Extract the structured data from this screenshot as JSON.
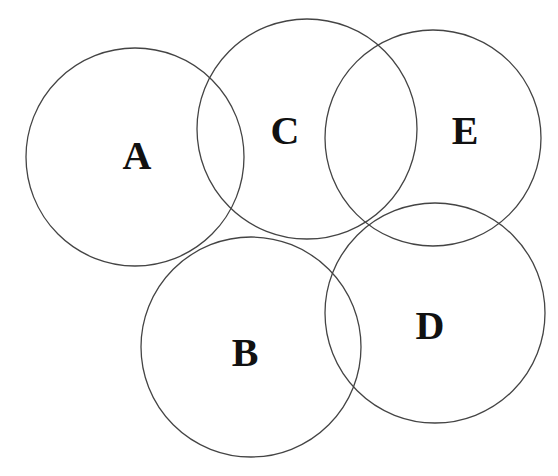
{
  "diagram": {
    "type": "overlapping-circles",
    "width": 558,
    "height": 476,
    "stroke_color": "#444444",
    "label_color": "#111111",
    "circles": [
      {
        "id": "A",
        "label": "A",
        "cx": 135,
        "cy": 157,
        "r": 109,
        "label_x": 137,
        "label_y": 155
      },
      {
        "id": "C",
        "label": "C",
        "cx": 307,
        "cy": 129,
        "r": 110,
        "label_x": 285,
        "label_y": 130
      },
      {
        "id": "E",
        "label": "E",
        "cx": 433,
        "cy": 138,
        "r": 108,
        "label_x": 465,
        "label_y": 130
      },
      {
        "id": "B",
        "label": "B",
        "cx": 251,
        "cy": 347,
        "r": 110,
        "label_x": 245,
        "label_y": 352
      },
      {
        "id": "D",
        "label": "D",
        "cx": 435,
        "cy": 313,
        "r": 110,
        "label_x": 430,
        "label_y": 325
      }
    ]
  }
}
